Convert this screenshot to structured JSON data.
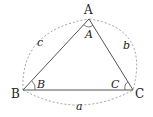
{
  "diagram": {
    "vertices": {
      "A": {
        "label": "A",
        "x": 89,
        "y": 19
      },
      "B": {
        "label": "B",
        "x": 23,
        "y": 90
      },
      "C": {
        "label": "C",
        "x": 133,
        "y": 90
      }
    },
    "angles": {
      "A": "A",
      "B": "B",
      "C": "C"
    },
    "sides": {
      "a": "a",
      "b": "b",
      "c": "c"
    },
    "colors": {
      "stroke": "#555555",
      "dashed": "#888888",
      "text": "#222222"
    }
  }
}
